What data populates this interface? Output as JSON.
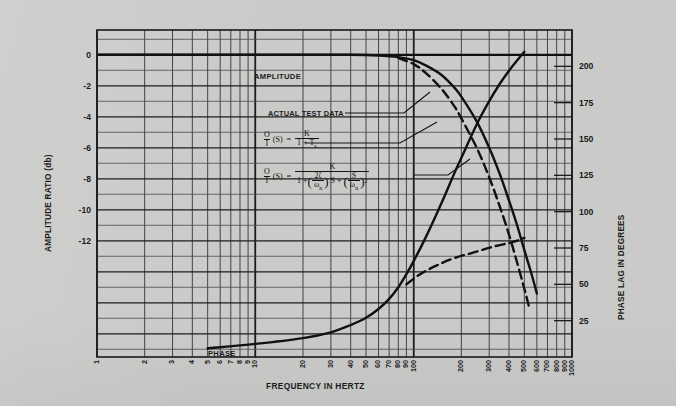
{
  "chart_data": {
    "type": "line",
    "title": "",
    "xlabel": "FREQUENCY IN HERTZ",
    "ylabel": "AMPLITUDE RATIO (db)",
    "y2label": "PHASE LAG IN DEGREES",
    "xscale": "log",
    "xlim": [
      1,
      1000
    ],
    "ylim": [
      -19.5,
      1.6
    ],
    "y2lim": [
      0,
      225
    ],
    "grid": true,
    "legend_position": "inline-annotations",
    "xticks": [
      1,
      2,
      3,
      4,
      5,
      6,
      7,
      8,
      9,
      10,
      20,
      30,
      40,
      50,
      60,
      70,
      80,
      90,
      100,
      200,
      300,
      400,
      500,
      600,
      700,
      800,
      900,
      1000
    ],
    "xticklabels": [
      "1",
      "2",
      "3",
      "4",
      "5",
      "6",
      "7",
      "8",
      "9",
      "10",
      "20",
      "30",
      "40",
      "50",
      "60",
      "70",
      "80",
      "90",
      "100",
      "200",
      "300",
      "400",
      "500",
      "600",
      "700",
      "800",
      "900",
      "1000"
    ],
    "yticks": [
      0,
      -2,
      -4,
      -6,
      -8,
      -10,
      -12
    ],
    "yticklabels": [
      "0",
      "-2",
      "-4",
      "-6",
      "-8",
      "-10",
      "-12"
    ],
    "y2ticks": [
      200,
      175,
      150,
      125,
      100,
      75,
      50,
      25
    ],
    "y2ticklabels": [
      "200",
      "175",
      "150",
      "125",
      "100",
      "75",
      "50",
      "25"
    ],
    "series": [
      {
        "name": "AMPLITUDE",
        "style": "solid",
        "axis": "left",
        "points": [
          [
            1,
            0.0
          ],
          [
            3,
            0.0
          ],
          [
            10,
            0.0
          ],
          [
            20,
            0.0
          ],
          [
            40,
            0.0
          ],
          [
            60,
            -0.05
          ],
          [
            80,
            -0.15
          ],
          [
            100,
            -0.35
          ],
          [
            120,
            -0.7
          ],
          [
            150,
            -1.3
          ],
          [
            180,
            -2.1
          ],
          [
            200,
            -2.7
          ],
          [
            250,
            -4.3
          ],
          [
            300,
            -6.0
          ],
          [
            350,
            -7.7
          ],
          [
            400,
            -9.4
          ],
          [
            450,
            -11.0
          ],
          [
            500,
            -12.6
          ],
          [
            550,
            -14.0
          ],
          [
            600,
            -15.4
          ]
        ]
      },
      {
        "name": "ACTUAL TEST DATA",
        "style": "dashed",
        "axis": "left",
        "points": [
          [
            80,
            -0.2
          ],
          [
            100,
            -0.6
          ],
          [
            120,
            -1.2
          ],
          [
            150,
            -2.2
          ],
          [
            180,
            -3.3
          ],
          [
            200,
            -4.1
          ],
          [
            250,
            -6.0
          ],
          [
            300,
            -7.9
          ],
          [
            350,
            -9.8
          ],
          [
            400,
            -11.6
          ],
          [
            450,
            -13.4
          ],
          [
            500,
            -15.1
          ],
          [
            540,
            -16.4
          ]
        ]
      },
      {
        "name": "PHASE",
        "style": "solid",
        "axis": "right",
        "points": [
          [
            5,
            6
          ],
          [
            10,
            9
          ],
          [
            20,
            13
          ],
          [
            30,
            17
          ],
          [
            40,
            22
          ],
          [
            50,
            27
          ],
          [
            60,
            33
          ],
          [
            70,
            40
          ],
          [
            80,
            48
          ],
          [
            90,
            57
          ],
          [
            100,
            66
          ],
          [
            120,
            83
          ],
          [
            150,
            106
          ],
          [
            180,
            126
          ],
          [
            200,
            137
          ],
          [
            250,
            160
          ],
          [
            300,
            176
          ],
          [
            350,
            188
          ],
          [
            400,
            197
          ],
          [
            450,
            204
          ],
          [
            500,
            210
          ]
        ]
      },
      {
        "name": "PHASE actual test data",
        "style": "dashed",
        "axis": "right",
        "points": [
          [
            90,
            50
          ],
          [
            110,
            57
          ],
          [
            140,
            63
          ],
          [
            180,
            68
          ],
          [
            240,
            72
          ],
          [
            320,
            76
          ],
          [
            420,
            79
          ],
          [
            500,
            82
          ]
        ]
      }
    ],
    "annotations": [
      {
        "text": "AMPLITUDE",
        "x": 22,
        "y": 0
      },
      {
        "text": "PHASE",
        "x": 4.6,
        "y": 3
      },
      {
        "text": "ACTUAL TEST DATA",
        "x": 13,
        "y": -3.1
      }
    ]
  },
  "axes": {
    "left_title": "AMPLITUDE RATIO (db)",
    "right_title": "PHASE LAG IN DEGREES",
    "bottom_title": "FREQUENCY IN HERTZ",
    "left_ticks": [
      "0",
      "-2",
      "-4",
      "-6",
      "-8",
      "-10",
      "-12"
    ],
    "right_ticks": [
      "200",
      "175",
      "150",
      "125",
      "100",
      "75",
      "50",
      "25"
    ],
    "bottom_ticks": [
      "1",
      "2",
      "3",
      "4",
      "5",
      "6",
      "7",
      "8",
      "9",
      "10",
      "20",
      "30",
      "40",
      "50",
      "60",
      "70",
      "80",
      "90",
      "100",
      "200",
      "300",
      "400",
      "500",
      "600",
      "700",
      "800",
      "900",
      "1000"
    ]
  },
  "labels": {
    "amplitude": "AMPLITUDE",
    "phase": "PHASE",
    "actual_test_data": "ACTUAL TEST DATA"
  },
  "formulas": {
    "first": {
      "lhs_num": "O",
      "lhs_den": "I",
      "lhs_arg": "(S)",
      "equals": "=",
      "rhs_num": "K",
      "rhs_den_a": "1 + T",
      "rhs_den_sub": "s"
    },
    "second": {
      "lhs_num": "O",
      "lhs_den": "I",
      "lhs_arg": "(S)",
      "equals": "=",
      "rhs_num": "K",
      "den_one": "1 +",
      "den_f1_num": "2ζ",
      "den_f1_den_a": "ω",
      "den_f1_den_sub": "n",
      "den_s1": "S +",
      "den_f2_num": "S",
      "den_f2_den_a": "ω",
      "den_f2_den_sub": "n",
      "den_sup": "2"
    }
  },
  "colors": {
    "paper": "#cacac8",
    "grid_minor": "#3a3a3a",
    "grid_major": "#1d1d1d",
    "curve": "#111111",
    "text": "#1b1b1b"
  }
}
